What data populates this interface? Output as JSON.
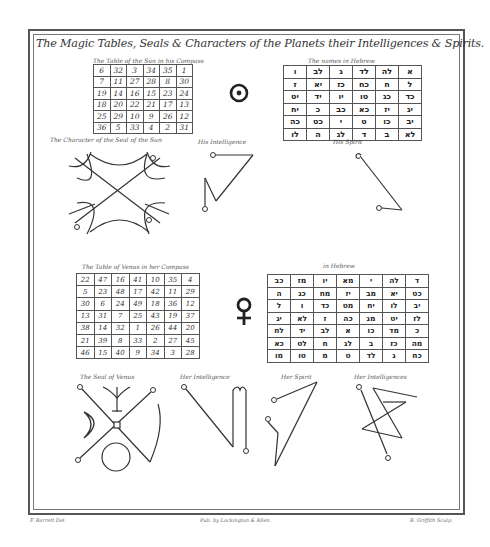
{
  "title": "The Magic Tables, Seals & Characters of the Planets their Intelligences & Spirits.",
  "sun": {
    "table_caption": "The Table of the Sun in his Compass",
    "table": [
      [
        "6",
        "32",
        "3",
        "34",
        "35",
        "1"
      ],
      [
        "7",
        "11",
        "27",
        "28",
        "8",
        "30"
      ],
      [
        "19",
        "14",
        "16",
        "15",
        "23",
        "24"
      ],
      [
        "18",
        "20",
        "22",
        "21",
        "17",
        "13"
      ],
      [
        "25",
        "29",
        "10",
        "9",
        "26",
        "12"
      ],
      [
        "36",
        "5",
        "33",
        "4",
        "2",
        "31"
      ]
    ],
    "hebrew_caption": "The names in Hebrew",
    "hebrew_table": [
      [
        "ו",
        "לב",
        "ג",
        "לד",
        "לה",
        "א"
      ],
      [
        "ז",
        "יא",
        "כז",
        "כח",
        "ח",
        "ל"
      ],
      [
        "יט",
        "יד",
        "יו",
        "טו",
        "כג",
        "כד"
      ],
      [
        "יח",
        "כ",
        "כב",
        "כא",
        "יז",
        "יג"
      ],
      [
        "כה",
        "כט",
        "י",
        "ט",
        "כו",
        "יב"
      ],
      [
        "לו",
        "ה",
        "לג",
        "ד",
        "ב",
        "לא"
      ]
    ],
    "symbol": "☉",
    "seal_caption": "The Character of the Seal of the Sun",
    "intelligence_caption": "His Intelligence",
    "spirit_caption": "His Spirit"
  },
  "venus": {
    "table_caption": "The Table of Venus in her Compass",
    "table": [
      [
        "22",
        "47",
        "16",
        "41",
        "10",
        "35",
        "4"
      ],
      [
        "5",
        "23",
        "48",
        "17",
        "42",
        "11",
        "29"
      ],
      [
        "30",
        "6",
        "24",
        "49",
        "18",
        "36",
        "12"
      ],
      [
        "13",
        "31",
        "7",
        "25",
        "43",
        "19",
        "37"
      ],
      [
        "38",
        "14",
        "32",
        "1",
        "26",
        "44",
        "20"
      ],
      [
        "21",
        "39",
        "8",
        "33",
        "2",
        "27",
        "45"
      ],
      [
        "46",
        "15",
        "40",
        "9",
        "34",
        "3",
        "28"
      ]
    ],
    "hebrew_caption": "in Hebrew",
    "hebrew_table": [
      [
        "כב",
        "מז",
        "יו",
        "מא",
        "י",
        "לה",
        "ד"
      ],
      [
        "ה",
        "כג",
        "מח",
        "יז",
        "מב",
        "יא",
        "כט"
      ],
      [
        "ל",
        "ו",
        "כד",
        "מט",
        "יח",
        "לו",
        "יב"
      ],
      [
        "יג",
        "לא",
        "ז",
        "כה",
        "מג",
        "יט",
        "לז"
      ],
      [
        "לח",
        "יד",
        "לב",
        "א",
        "כו",
        "מד",
        "כ"
      ],
      [
        "כא",
        "לט",
        "ח",
        "לג",
        "ב",
        "כז",
        "מה"
      ],
      [
        "מו",
        "טו",
        "מ",
        "ט",
        "לד",
        "ג",
        "כח"
      ]
    ],
    "symbol": "♀",
    "seal_caption": "The Seal of Venus",
    "intelligence_caption": "Her Intelligence",
    "spirit_caption": "Her Spirit",
    "intelligences_caption": "Her Intelligences"
  },
  "credits": {
    "left": "F. Barrett Del.",
    "center": "Pub. by Lackington & Allen.",
    "right": "R. Griffith Sculp."
  },
  "colors": {
    "ink": "#333333",
    "paper": "#ffffff",
    "frame": "#555555"
  }
}
